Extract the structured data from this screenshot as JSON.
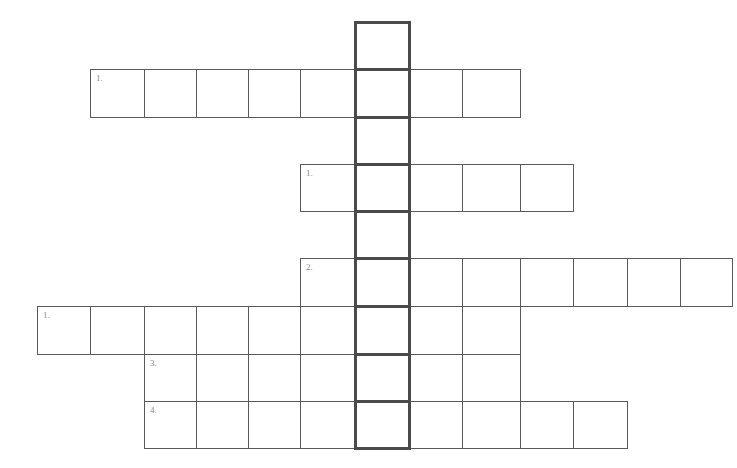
{
  "puzzle": {
    "type": "crossword",
    "key_column": 5,
    "columns_x": [
      37,
      90,
      144,
      196,
      248,
      300,
      355,
      409,
      462,
      520,
      573,
      627,
      680,
      732
    ],
    "rows_y": [
      22,
      69,
      117,
      164,
      211,
      258,
      306,
      354,
      401,
      448
    ],
    "colors": {
      "cell_border": "#5a5a5a",
      "key_border": "#4a4a4a",
      "label": "#8a8a8a",
      "background": "#ffffff"
    },
    "rows": [
      {
        "row": 0,
        "start_col": 6,
        "end_col": 6,
        "label": ""
      },
      {
        "row": 1,
        "start_col": 1,
        "end_col": 8,
        "label": "1."
      },
      {
        "row": 2,
        "start_col": 6,
        "end_col": 6,
        "label": ""
      },
      {
        "row": 3,
        "start_col": 5,
        "end_col": 9,
        "label": "1."
      },
      {
        "row": 4,
        "start_col": 6,
        "end_col": 6,
        "label": ""
      },
      {
        "row": 5,
        "start_col": 5,
        "end_col": 12,
        "label": "2."
      },
      {
        "row": 6,
        "start_col": 0,
        "end_col": 8,
        "label": "1."
      },
      {
        "row": 7,
        "start_col": 2,
        "end_col": 8,
        "label": "3."
      },
      {
        "row": 8,
        "start_col": 2,
        "end_col": 10,
        "label": "4."
      }
    ]
  }
}
